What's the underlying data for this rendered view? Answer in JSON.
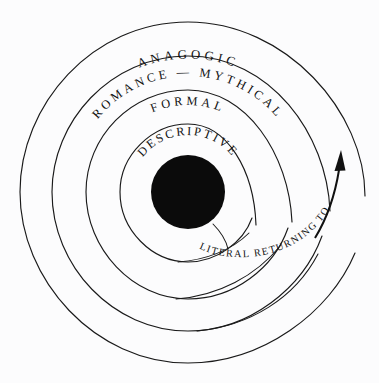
{
  "diagram": {
    "type": "concentric-spiral",
    "background_color": "#fcfcfd",
    "line_color": "#1a1a1a",
    "core_color": "#0b0b0b",
    "center": {
      "x": 188,
      "y": 192
    },
    "core_radius": 37,
    "rings": [
      {
        "index": 0,
        "label": "DESCRIPTIVE",
        "name": "ring-descriptive",
        "radius": 68,
        "label_radius": 55
      },
      {
        "index": 1,
        "label": "FORMAL",
        "name": "ring-formal",
        "radius": 100,
        "label_radius": 86
      },
      {
        "index": 2,
        "label": "ROMANCE — MYTHICAL",
        "name": "ring-romance-mythical",
        "radius": 132,
        "label_radius": 118
      },
      {
        "index": 3,
        "label": "ANAGOGIC",
        "name": "ring-anagogic",
        "radius": 164,
        "label_radius": 150
      }
    ],
    "spiral_label": {
      "text": "LITERAL RETURNING TO",
      "name": "spiral-literal-returning-to"
    },
    "arrow": {
      "name": "direction-arrow",
      "description": "upward arrow at right side of spiral",
      "tip_x": 341,
      "tip_y": 152
    }
  }
}
